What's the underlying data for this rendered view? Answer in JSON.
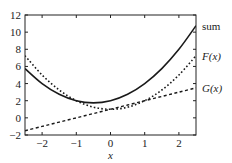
{
  "chart_data": {
    "type": "line",
    "title": "",
    "xlabel": "x",
    "ylabel": "",
    "xlim": [
      -2.5,
      2.5
    ],
    "ylim": [
      -2,
      12
    ],
    "xticks": [
      -2,
      -1,
      0,
      1,
      2
    ],
    "xtick_labels": [
      "−2",
      "−1",
      "0",
      "1",
      "2"
    ],
    "yticks": [
      -2,
      0,
      2,
      4,
      6,
      8,
      10,
      12
    ],
    "ytick_labels": [
      "−2",
      "0",
      "2",
      "4",
      "6",
      "8",
      "10",
      "12"
    ],
    "grid": false,
    "legend_position": "right, inline labels",
    "x": [
      -2.5,
      -2,
      -1.5,
      -1,
      -0.5,
      0,
      0.5,
      1,
      1.5,
      2,
      2.5
    ],
    "series": [
      {
        "name": "sum",
        "style": "solid",
        "values": [
          5.75,
          4.0,
          2.75,
          2.0,
          1.75,
          2.0,
          2.75,
          4.0,
          5.75,
          8.0,
          10.75
        ]
      },
      {
        "name": "F(x)",
        "style": "dotted",
        "values": [
          7.25,
          5.0,
          3.25,
          2.0,
          1.25,
          1.0,
          1.25,
          2.0,
          3.25,
          5.0,
          7.25
        ]
      },
      {
        "name": "G(x)",
        "style": "dashed",
        "values": [
          -1.5,
          -1.0,
          -0.5,
          0.0,
          0.5,
          1.0,
          1.5,
          2.0,
          2.5,
          3.0,
          3.5
        ]
      }
    ]
  },
  "labels": {
    "sum": "sum",
    "F": "F(x)",
    "G": "G(x)",
    "xaxis": "x"
  }
}
